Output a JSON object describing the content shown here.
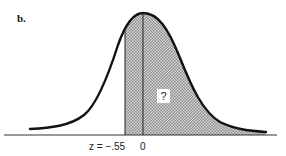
{
  "figure": {
    "panel_label": "b.",
    "z_label": "z = −.55",
    "zero_label": "0",
    "shaded_area_label": "?",
    "colors": {
      "curve": "#111111",
      "shade": "#b8b8b8",
      "background": "#ffffff"
    }
  }
}
